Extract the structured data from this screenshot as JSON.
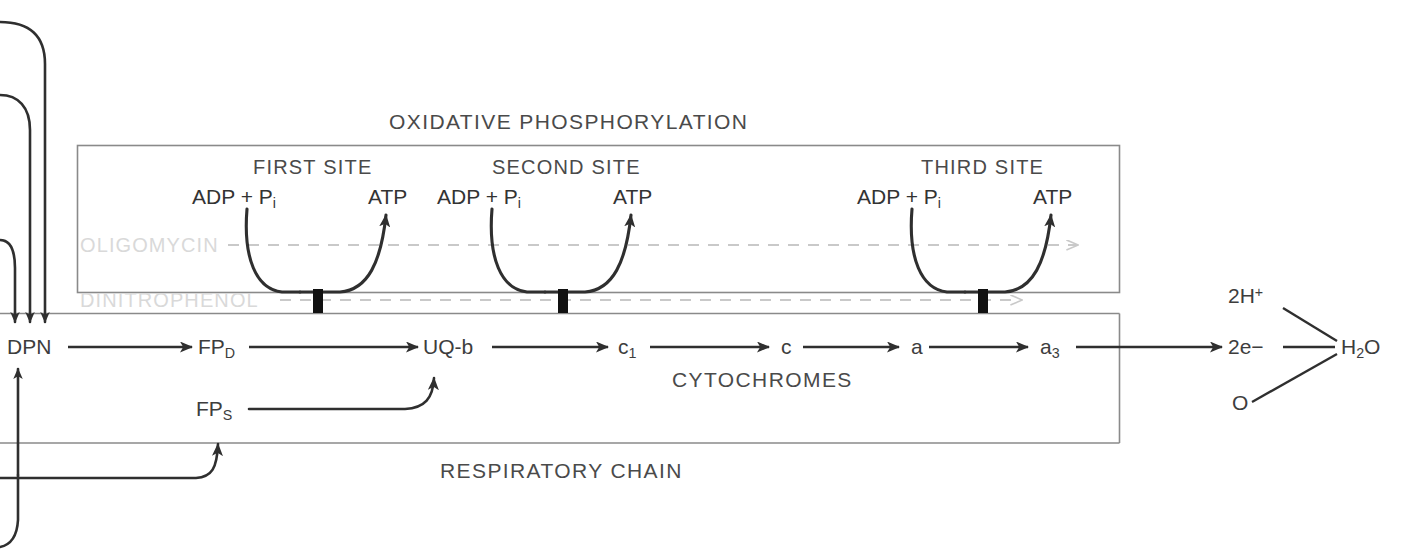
{
  "diagram": {
    "title": "OXIDATIVE PHOSPHORYLATION",
    "bottom_title": "RESPIRATORY CHAIN",
    "cytochromes_label": "CYTOCHROMES",
    "colors": {
      "line": "#2f2f2f",
      "box_border": "#8a8a8a",
      "inhibitor_text": "#d9d9d9",
      "inhibitor_dash": "#c9c9c9",
      "background": "#ffffff"
    }
  },
  "sites": [
    {
      "title": "FIRST SITE",
      "substrate": "ADP + P",
      "substrate_sub": "i",
      "product": "ATP"
    },
    {
      "title": "SECOND SITE",
      "substrate": "ADP + P",
      "substrate_sub": "i",
      "product": "ATP"
    },
    {
      "title": "THIRD SITE",
      "substrate": "ADP + P",
      "substrate_sub": "i",
      "product": "ATP"
    }
  ],
  "inhibitors": [
    {
      "name": "OLIGOMYCIN"
    },
    {
      "name": "DINITROPHENOL"
    }
  ],
  "chain": {
    "carriers": [
      {
        "label": "DPN",
        "sub": ""
      },
      {
        "label": "FP",
        "sub": "D"
      },
      {
        "label": "UQ-b",
        "sub": ""
      },
      {
        "label": "c",
        "sub": "1"
      },
      {
        "label": "c",
        "sub": ""
      },
      {
        "label": "a",
        "sub": ""
      },
      {
        "label": "a",
        "sub": "3"
      }
    ],
    "branch": {
      "label": "FP",
      "sub": "S"
    }
  },
  "terminal": {
    "electrons": "2e−",
    "protons": "2H",
    "protons_sup": "+",
    "oxygen": "O",
    "water": "H",
    "water_sub": "2",
    "water_tail": "O"
  }
}
